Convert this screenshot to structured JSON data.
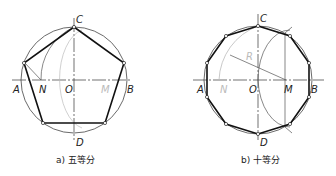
{
  "figures": [
    {
      "caption": "a) 五等分",
      "labels": {
        "A": "A",
        "B": "B",
        "C": "C",
        "D": "D",
        "O": "O",
        "N": "N",
        "M": "M"
      }
    },
    {
      "caption": "b) 十等分",
      "labels": {
        "A": "A",
        "B": "B",
        "C": "C",
        "D": "D",
        "O": "O",
        "N": "N",
        "M": "M",
        "R": "R"
      }
    }
  ],
  "colors": {
    "line": "#222222",
    "thin": "#555555",
    "faint": "#bbbbbb"
  }
}
